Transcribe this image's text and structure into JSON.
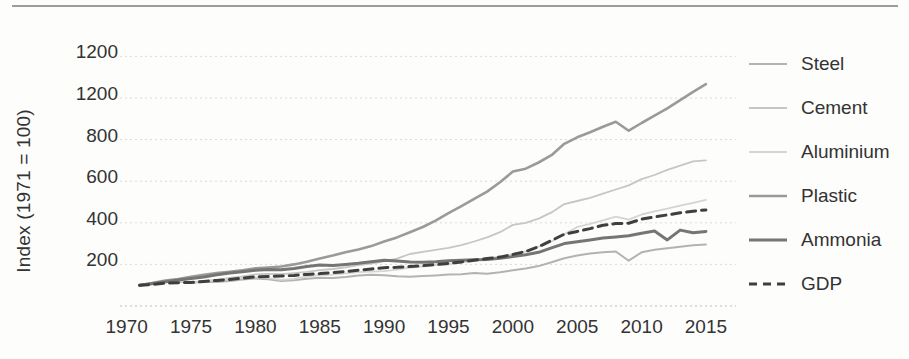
{
  "chart_data": {
    "type": "line",
    "title": "",
    "xlabel": "",
    "ylabel": "Index (1971 = 100)",
    "x_range": [
      1970,
      2016
    ],
    "y_range": [
      0,
      1290
    ],
    "grid": true,
    "legend_position": "right",
    "x_ticks": [
      {
        "value": 1970,
        "label": "1970"
      },
      {
        "value": 1975,
        "label": "1975"
      },
      {
        "value": 1980,
        "label": "1980"
      },
      {
        "value": 1985,
        "label": "1985"
      },
      {
        "value": 1990,
        "label": "1990"
      },
      {
        "value": 1995,
        "label": "1995"
      },
      {
        "value": 2000,
        "label": "2000"
      },
      {
        "value": 2005,
        "label": "2005"
      },
      {
        "value": 2010,
        "label": "2010"
      },
      {
        "value": 2015,
        "label": "2015"
      }
    ],
    "y_ticks": [
      {
        "value": 1200,
        "label": "1200"
      },
      {
        "value": 1000,
        "label": "1200"
      },
      {
        "value": 800,
        "label": "800"
      },
      {
        "value": 600,
        "label": "600"
      },
      {
        "value": 400,
        "label": "400"
      },
      {
        "value": 200,
        "label": "200"
      }
    ],
    "years": [
      1971,
      1972,
      1973,
      1974,
      1975,
      1976,
      1977,
      1978,
      1979,
      1980,
      1981,
      1982,
      1983,
      1984,
      1985,
      1986,
      1987,
      1988,
      1989,
      1990,
      1991,
      1992,
      1993,
      1994,
      1995,
      1996,
      1997,
      1998,
      1999,
      2000,
      2001,
      2002,
      2003,
      2004,
      2005,
      2006,
      2007,
      2008,
      2009,
      2010,
      2011,
      2012,
      2013,
      2014,
      2015
    ],
    "series": [
      {
        "name": "Steel",
        "color": "#b3b3b3",
        "width": 2,
        "dash": null,
        "values": [
          100,
          105,
          116,
          122,
          112,
          116,
          115,
          120,
          127,
          132,
          129,
          120,
          124,
          131,
          136,
          135,
          139,
          146,
          150,
          148,
          143,
          141,
          144,
          147,
          151,
          153,
          159,
          155,
          162,
          172,
          180,
          192,
          210,
          230,
          243,
          252,
          258,
          262,
          218,
          258,
          270,
          278,
          285,
          292,
          295
        ]
      },
      {
        "name": "Cement",
        "color": "#c6c6c6",
        "width": 1.8,
        "dash": null,
        "values": [
          100,
          107,
          114,
          116,
          115,
          119,
          126,
          135,
          142,
          152,
          154,
          153,
          158,
          164,
          172,
          178,
          186,
          196,
          204,
          215,
          228,
          250,
          260,
          270,
          280,
          293,
          310,
          330,
          355,
          390,
          400,
          420,
          450,
          490,
          505,
          520,
          540,
          560,
          580,
          610,
          630,
          655,
          675,
          695,
          700
        ]
      },
      {
        "name": "Aluminium",
        "color": "#d4d4d4",
        "width": 1.8,
        "dash": null,
        "values": [
          100,
          106,
          115,
          120,
          113,
          119,
          125,
          130,
          135,
          138,
          134,
          126,
          131,
          142,
          148,
          151,
          157,
          163,
          166,
          168,
          175,
          185,
          190,
          196,
          200,
          208,
          218,
          228,
          238,
          250,
          262,
          285,
          310,
          345,
          380,
          395,
          412,
          430,
          415,
          440,
          455,
          468,
          482,
          496,
          510
        ]
      },
      {
        "name": "Plastic",
        "color": "#9a9a9a",
        "width": 2.6,
        "dash": null,
        "values": [
          100,
          110,
          122,
          130,
          141,
          150,
          158,
          165,
          172,
          181,
          185,
          190,
          200,
          213,
          229,
          243,
          258,
          272,
          288,
          310,
          330,
          355,
          380,
          410,
          446,
          480,
          515,
          550,
          595,
          646,
          660,
          690,
          725,
          780,
          811,
          835,
          862,
          886,
          843,
          880,
          915,
          950,
          990,
          1030,
          1067
        ]
      },
      {
        "name": "Ammonia",
        "color": "#757575",
        "width": 3,
        "dash": null,
        "values": [
          100,
          108,
          117,
          125,
          132,
          140,
          150,
          158,
          165,
          172,
          176,
          174,
          180,
          190,
          197,
          195,
          200,
          206,
          213,
          220,
          217,
          212,
          210,
          213,
          218,
          220,
          222,
          224,
          230,
          238,
          246,
          258,
          280,
          300,
          309,
          318,
          327,
          332,
          338,
          350,
          360,
          318,
          365,
          352,
          358
        ]
      },
      {
        "name": "GDP",
        "color": "#3f3f3f",
        "width": 3,
        "dash": "9 6",
        "values": [
          100,
          104,
          110,
          112,
          113,
          118,
          123,
          128,
          134,
          140,
          142,
          144,
          147,
          152,
          156,
          161,
          166,
          172,
          178,
          184,
          186,
          190,
          194,
          199,
          205,
          212,
          220,
          228,
          235,
          248,
          262,
          285,
          315,
          345,
          358,
          372,
          388,
          396,
          398,
          418,
          428,
          438,
          448,
          456,
          462
        ]
      }
    ]
  }
}
